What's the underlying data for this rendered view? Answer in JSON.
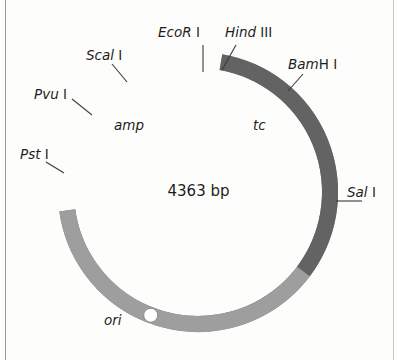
{
  "figure": {
    "kind": "plasmid-map",
    "organism_vector": "pBR322-like circular plasmid",
    "size_label": "4363 bp",
    "background_color": "#fdfdfc",
    "text_color": "#1d1d1d"
  },
  "ring": {
    "center_x": 198,
    "center_y": 192,
    "outer_radius": 140,
    "thickness": 16,
    "segments": [
      {
        "name": "amp-segment",
        "label": "amp",
        "color": "#6f6f6f",
        "start_deg": -66,
        "end_deg": 172
      },
      {
        "name": "polylinker-segment",
        "label": "",
        "color": "#9b9b9b",
        "start_deg": -80,
        "end_deg": -66
      },
      {
        "name": "tc-segment",
        "label": "tc",
        "color": "#636363",
        "start_deg": -80,
        "end_deg": 37
      },
      {
        "name": "ori-segment",
        "label": "ori",
        "color": "#9e9e9e",
        "start_deg": 37,
        "end_deg": 172
      }
    ]
  },
  "sites": [
    {
      "name": "ecori-site",
      "italic": "EcoR",
      "upright": " I",
      "angle_deg": -88.5,
      "label_left": 158,
      "label_top": 26,
      "leader": "vertical"
    },
    {
      "name": "hindiii-site",
      "italic": "Hind",
      "upright": " III",
      "angle_deg": -79.0,
      "label_left": 225,
      "label_top": 26,
      "leader": "diagonal"
    },
    {
      "name": "scai-site",
      "italic": "Scal",
      "upright": " I",
      "angle_deg": -128.0,
      "label_left": 86,
      "label_top": 49,
      "leader": "diagonal"
    },
    {
      "name": "pvui-site",
      "italic": "Pvu",
      "upright": " I",
      "angle_deg": -151.0,
      "label_left": 34,
      "label_top": 88,
      "leader": "diagonal"
    },
    {
      "name": "psti-site",
      "italic": "Pst",
      "upright": " I",
      "angle_deg": 171.0,
      "label_left": 20,
      "label_top": 148,
      "leader": "diagonal"
    },
    {
      "name": "bamhi-site",
      "italic": "Bam",
      "upright": "H I",
      "angle_deg": -47.0,
      "label_left": 288,
      "label_top": 58,
      "leader": "diagonal"
    },
    {
      "name": "sali-site",
      "italic": "Sal",
      "upright": " I",
      "angle_deg": 6.0,
      "label_left": 347,
      "label_top": 186,
      "leader": "horizontal"
    }
  ],
  "gene_labels": [
    {
      "name": "amp-label",
      "text": "amp",
      "left": 114,
      "top": 119
    },
    {
      "name": "tc-label",
      "text": "tc",
      "left": 253,
      "top": 119
    },
    {
      "name": "ori-label",
      "text": "ori",
      "left": 104,
      "top": 314
    }
  ],
  "ori_marker": {
    "name": "ori-marker",
    "angle_deg": 111.0,
    "radius": 7,
    "fill": "#ffffff",
    "stroke": "#8a8a8a"
  },
  "colors": {
    "amp_gray": "#6f6f6f",
    "tc_gray": "#636363",
    "ori_gray": "#9e9e9e",
    "polylinker_gray": "#9b9b9b",
    "leader_line": "#3a3a3a"
  }
}
